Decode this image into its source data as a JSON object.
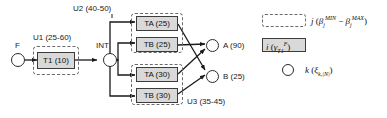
{
  "diagram": {
    "type": "workflow-network",
    "start_node": {
      "label": "F"
    },
    "intermediate_node": {
      "label": "INT"
    },
    "groups": [
      {
        "id": "u1",
        "label": "U1 (25-60)"
      },
      {
        "id": "u2",
        "label": "U2 (40-50)"
      },
      {
        "id": "u3",
        "label": "U3 (35-45)"
      }
    ],
    "tasks": [
      {
        "id": "t1",
        "label": "T1 (10)",
        "group": "u1"
      },
      {
        "id": "ta25",
        "label": "TA (25)",
        "group": "u2"
      },
      {
        "id": "tb25",
        "label": "TB (25)",
        "group": "u2"
      },
      {
        "id": "ta30",
        "label": "TA (30)",
        "group": "u3"
      },
      {
        "id": "tb30",
        "label": "TB (30)",
        "group": "u3"
      }
    ],
    "outputs": [
      {
        "id": "a",
        "label": "A (90)"
      },
      {
        "id": "b",
        "label": "B (25)"
      }
    ]
  },
  "legend": {
    "items": [
      {
        "symbol": "dashed-rectangle",
        "name": "group-symbol",
        "text_prefix": "j",
        "text_arg_open": " (",
        "var1": "β",
        "var1_sub": "j",
        "var1_sup": "MIN",
        "minus": " − ",
        "var2": "β",
        "var2_sub": "j",
        "var2_sup": "MAX",
        "text_arg_close": ")"
      },
      {
        "symbol": "gray-rectangle",
        "name": "task-symbol",
        "text_prefix": "i",
        "text_arg_open": " (",
        "var1": "γ",
        "var1_sub": "T1",
        "var1_sup": "F",
        "text_arg_close": ")"
      },
      {
        "symbol": "circle",
        "name": "node-symbol",
        "text_prefix": "k",
        "text_arg_open": " (",
        "var1": "ξ",
        "var1_sub": "k,|N|",
        "text_arg_close": ")"
      }
    ]
  },
  "colors": {
    "task_fill": "#d9d9d9",
    "stroke": "#2b2b2b",
    "dashed_stroke": "#6b6b6b",
    "background": "#ffffff"
  }
}
